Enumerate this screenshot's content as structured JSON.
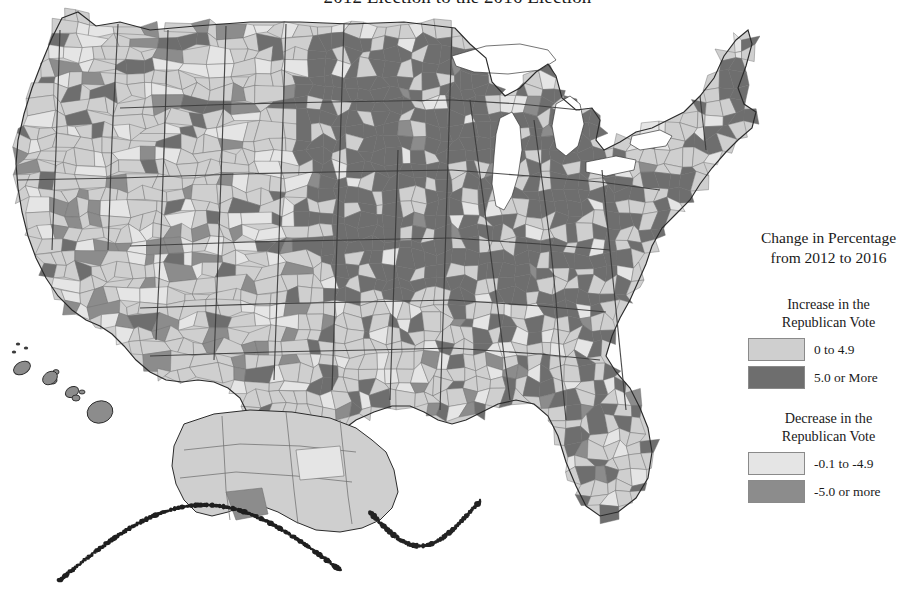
{
  "title": "2012 Election to the 2016 Election",
  "legend": {
    "title_line1": "Change in Percentage",
    "title_line2": "from 2012 to 2016",
    "groups": [
      {
        "heading_line1": "Increase in the",
        "heading_line2": "Republican Vote",
        "entries": [
          {
            "label": "0 to 4.9",
            "color": "#cfcfcf"
          },
          {
            "label": "5.0 or More",
            "color": "#6e6e6e"
          }
        ]
      },
      {
        "heading_line1": "Decrease in the",
        "heading_line2": "Republican Vote",
        "entries": [
          {
            "label": "-0.1 to -4.9",
            "color": "#e5e5e5"
          },
          {
            "label": "-5.0 or more",
            "color": "#8c8c8c"
          }
        ]
      }
    ]
  },
  "map": {
    "type": "choropleth",
    "geography": "United States counties",
    "background": "#ffffff",
    "border_color": "#707070",
    "state_border_color": "#3a3a3a",
    "insets": [
      "Alaska",
      "Hawaii"
    ],
    "classes": [
      {
        "name": "increase-small",
        "label": "0 to 4.9",
        "color": "#cfcfcf"
      },
      {
        "name": "increase-large",
        "label": "5.0 or More",
        "color": "#6e6e6e"
      },
      {
        "name": "decrease-small",
        "label": "-0.1 to -4.9",
        "color": "#e5e5e5"
      },
      {
        "name": "decrease-large",
        "label": "-5.0 or more",
        "color": "#8c8c8c"
      }
    ],
    "regional_pattern": [
      {
        "region": "Upper Midwest",
        "dominant_class": "increase-large"
      },
      {
        "region": "Great Lakes",
        "dominant_class": "increase-large"
      },
      {
        "region": "Appalachia",
        "dominant_class": "increase-large"
      },
      {
        "region": "Northern New England",
        "dominant_class": "increase-large"
      },
      {
        "region": "Mountain West",
        "dominant_class": "increase-small"
      },
      {
        "region": "Great Plains",
        "dominant_class": "increase-small"
      },
      {
        "region": "South Texas border",
        "dominant_class": "decrease-large"
      },
      {
        "region": "Southwest Arizona and Utah",
        "dominant_class": "decrease-large"
      },
      {
        "region": "Florida peninsula",
        "dominant_class": "increase-small"
      },
      {
        "region": "Alaska",
        "dominant_class": "increase-small"
      },
      {
        "region": "Hawaii",
        "dominant_class": "decrease-large"
      }
    ]
  }
}
